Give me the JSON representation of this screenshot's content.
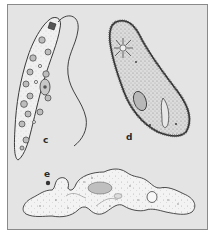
{
  "figure": {
    "background_color": "#e4e4e4",
    "border_color": "#8a8a8a",
    "organisms": [
      {
        "id": "c",
        "label": "c",
        "kind": "flagellate",
        "body_fill": "#f2f2f2"
      },
      {
        "id": "d",
        "label": "d",
        "kind": "ciliate",
        "body_fill": "#d6d6d6"
      },
      {
        "id": "e",
        "label": "e",
        "kind": "amoeba",
        "body_fill": "#f4f4f4"
      }
    ]
  }
}
